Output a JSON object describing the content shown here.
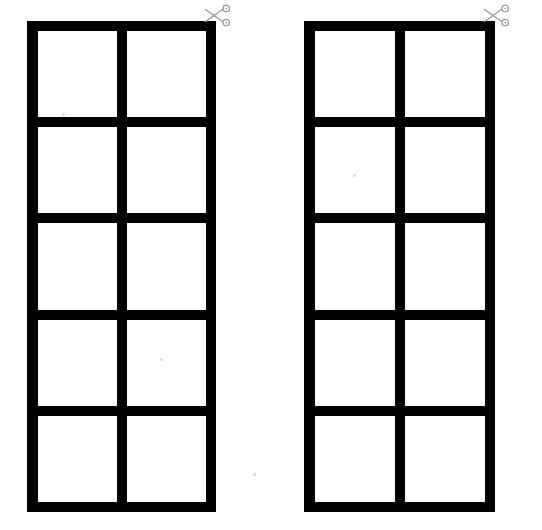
{
  "page": {
    "title": "Cut-Out Grid Worksheet",
    "background_color": "#ffffff",
    "ink_color": "#000000",
    "width": 542,
    "height": 530
  },
  "worksheet": {
    "panels": [
      {
        "name": "left-grid",
        "label": "Left cut-out grid",
        "rows": 5,
        "columns": 2,
        "cells": [
          {
            "label": ""
          },
          {
            "label": ""
          },
          {
            "label": ""
          },
          {
            "label": ""
          },
          {
            "label": ""
          },
          {
            "label": ""
          },
          {
            "label": ""
          },
          {
            "label": ""
          },
          {
            "label": ""
          },
          {
            "label": ""
          }
        ],
        "cut_marker": {
          "icon": "scissors-icon",
          "label": "Cut here",
          "color": "#9a9a9a",
          "position": "top-right"
        }
      },
      {
        "name": "right-grid",
        "label": "Right cut-out grid",
        "rows": 5,
        "columns": 2,
        "cells": [
          {
            "label": ""
          },
          {
            "label": ""
          },
          {
            "label": ""
          },
          {
            "label": ""
          },
          {
            "label": ""
          },
          {
            "label": ""
          },
          {
            "label": ""
          },
          {
            "label": ""
          },
          {
            "label": ""
          },
          {
            "label": ""
          }
        ],
        "cut_marker": {
          "icon": "scissors-icon",
          "label": "Cut here",
          "color": "#9a9a9a",
          "position": "top-right"
        }
      }
    ]
  }
}
